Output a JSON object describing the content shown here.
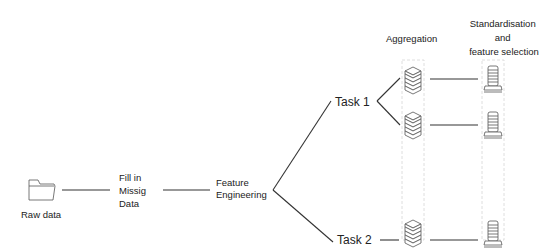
{
  "diagram": {
    "nodes": {
      "raw_data": {
        "label": "Raw data",
        "icon": "folder-icon"
      },
      "fill_missing": {
        "lines": [
          "Fill in",
          "Missig",
          "Data"
        ]
      },
      "feature_engineering": {
        "lines": [
          "Feature",
          "Engineering"
        ]
      },
      "task1": {
        "label": "Task 1"
      },
      "task2": {
        "label": "Task 2"
      }
    },
    "columns": {
      "aggregation": {
        "label": "Aggregation",
        "icon": "stacked-layers-icon"
      },
      "standardisation": {
        "lines": [
          "Standardisation",
          "and",
          "feature selection"
        ],
        "icon": "cylinder-stack-icon"
      }
    },
    "edges": [
      [
        "raw_data",
        "fill_missing"
      ],
      [
        "fill_missing",
        "feature_engineering"
      ],
      [
        "feature_engineering",
        "task1"
      ],
      [
        "feature_engineering",
        "task2"
      ],
      [
        "task1",
        "aggregation_1"
      ],
      [
        "task1",
        "aggregation_2"
      ],
      [
        "task2",
        "aggregation_3"
      ],
      [
        "aggregation_1",
        "standardisation_1"
      ],
      [
        "aggregation_2",
        "standardisation_2"
      ],
      [
        "aggregation_3",
        "standardisation_3"
      ]
    ]
  }
}
